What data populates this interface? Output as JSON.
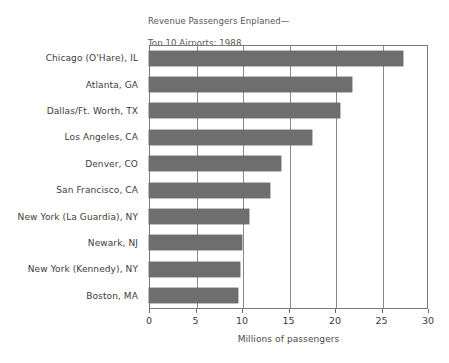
{
  "chart_data": {
    "type": "bar",
    "orientation": "horizontal",
    "title": "Revenue Passengers Enplaned—\nTop 10 Airports: 1988",
    "title_line1": "Revenue Passengers Enplaned—",
    "title_line2": "Top 10 Airports: 1988",
    "categories": [
      "Chicago (O'Hare), IL",
      "Atlanta, GA",
      "Dallas/Ft. Worth, TX",
      "Los Angeles, CA",
      "Denver, CO",
      "San Francisco, CA",
      "New York (La Guardia), NY",
      "Newark, NJ",
      "New York (Kennedy), NY",
      "Boston, MA"
    ],
    "values": [
      27.3,
      21.8,
      20.5,
      17.5,
      14.2,
      13.0,
      10.7,
      10.0,
      9.8,
      9.6
    ],
    "xlabel": "Millions of passengers",
    "ylabel": "",
    "xlim": [
      0,
      30
    ],
    "xticks": [
      0,
      5,
      10,
      15,
      20,
      25,
      30
    ],
    "xtick_labels": [
      "0",
      "5",
      "10",
      "15",
      "20",
      "25",
      "30"
    ],
    "grid": "vertical",
    "legend": "none",
    "bar_color": "#6e6e6e",
    "axis_color": "#7a7a7a",
    "title_color": "#555555",
    "text_color": "#3c3c3c"
  }
}
